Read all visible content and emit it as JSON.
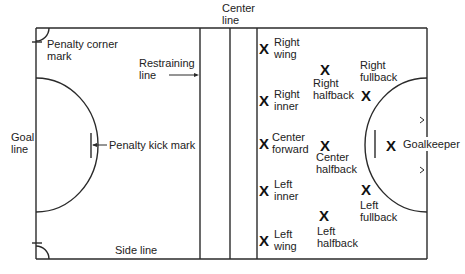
{
  "colors": {
    "line": "#2a2a2a",
    "text": "#222222",
    "background": "#ffffff"
  },
  "field_labels": {
    "center_line": [
      "Center",
      "line"
    ],
    "restraining_line": [
      "Restraining",
      "line"
    ],
    "penalty_corner_mark": [
      "Penalty corner",
      "mark"
    ],
    "goal_line": [
      "Goal",
      "line"
    ],
    "penalty_kick_mark": "Penalty kick mark",
    "side_line": "Side line"
  },
  "player_marker": "X",
  "players": [
    {
      "id": "right-wing",
      "lines": [
        "Right",
        "wing"
      ]
    },
    {
      "id": "right-inner",
      "lines": [
        "Right",
        "inner"
      ]
    },
    {
      "id": "center-forward",
      "lines": [
        "Center",
        "forward"
      ]
    },
    {
      "id": "left-inner",
      "lines": [
        "Left",
        "inner"
      ]
    },
    {
      "id": "left-wing",
      "lines": [
        "Left",
        "wing"
      ]
    },
    {
      "id": "right-halfback",
      "lines": [
        "Right",
        "halfback"
      ]
    },
    {
      "id": "center-halfback",
      "lines": [
        "Center",
        "halfback"
      ]
    },
    {
      "id": "left-halfback",
      "lines": [
        "Left",
        "halfback"
      ]
    },
    {
      "id": "right-fullback",
      "lines": [
        "Right",
        "fullback"
      ]
    },
    {
      "id": "left-fullback",
      "lines": [
        "Left",
        "fullback"
      ]
    },
    {
      "id": "goalkeeper",
      "lines": [
        "Goalkeeper"
      ]
    }
  ]
}
